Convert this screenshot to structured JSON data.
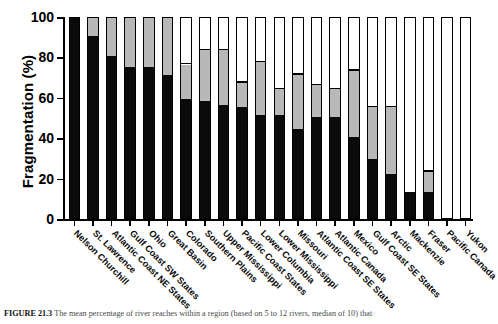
{
  "chart_data": {
    "type": "bar",
    "stacked": true,
    "title": "",
    "subtitle": "",
    "xlabel": "",
    "ylabel": "Fragmentation (%)",
    "ylim": [
      0,
      100
    ],
    "yticks": [
      0,
      20,
      40,
      60,
      80,
      100
    ],
    "ytick_labels": [
      "0",
      "20",
      "40",
      "60",
      "80",
      "100"
    ],
    "grid": false,
    "legend_position": "none",
    "categories": [
      "Nelson Churchill",
      "St. Lawrence",
      "Atlantic Coast NE States",
      "Gulf Coast SW States",
      "Ohio",
      "Great Basin",
      "Colorado",
      "Southern Plains",
      "Upper Mississippi",
      "Pacific Coast States",
      "Lower Columbia",
      "Lower Mississippi",
      "Missouri",
      "Atlantic Coast SE States",
      "Atlantic Canada",
      "Mexico",
      "Gulf Coast SE States",
      "Arctic",
      "Mackenzie",
      "Fraser",
      "Pacific Canada",
      "Yukon"
    ],
    "series": [
      {
        "name": "strongly-fragmented",
        "color": "#0b0b0b",
        "values": [
          100,
          90,
          80,
          75,
          75,
          71,
          59,
          58,
          56,
          55,
          51,
          51,
          44,
          50,
          50,
          40,
          29,
          22,
          13,
          13,
          0,
          0
        ]
      },
      {
        "name": "moderately-fragmented",
        "color": "#b8b8b8",
        "values": [
          0,
          10,
          20,
          25,
          25,
          29,
          17,
          25,
          27,
          12,
          26,
          13,
          27,
          16,
          14,
          33,
          26,
          33,
          0,
          10,
          0,
          0
        ]
      },
      {
        "name": "unfragmented",
        "color": "#ffffff",
        "values": [
          0,
          0,
          0,
          0,
          0,
          0,
          24,
          17,
          17,
          33,
          23,
          36,
          29,
          34,
          36,
          27,
          45,
          45,
          87,
          77,
          100,
          100
        ]
      }
    ],
    "cumulative_black_plus_gray": [
      100,
      100,
      100,
      100,
      100,
      100,
      76,
      83,
      83,
      67,
      77,
      64,
      71,
      66,
      64,
      73,
      55,
      55,
      13,
      23,
      0,
      0
    ]
  },
  "caption": {
    "figure_number": "FIGURE 21.3",
    "text": "The mean percentage of river reaches within a region (based on 5 to 12 rivers, median of 10) that"
  }
}
